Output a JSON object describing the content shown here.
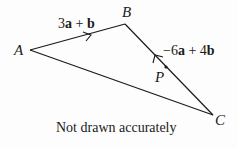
{
  "diagram": {
    "points": {
      "A": {
        "label": "A",
        "x": 30,
        "y": 50
      },
      "B": {
        "label": "B",
        "x": 125,
        "y": 24
      },
      "C": {
        "label": "C",
        "x": 213,
        "y": 115
      },
      "P": {
        "label": "P",
        "x": 166,
        "y": 67
      }
    },
    "vectors": {
      "AB": {
        "label": "3a + b",
        "parts": [
          "3",
          "a",
          " + ",
          "b"
        ]
      },
      "CB": {
        "label": "−6a + 4b",
        "parts": [
          "−6",
          "a",
          " + 4",
          "b"
        ]
      }
    },
    "note": "Not drawn accurately",
    "line_color": "#1a1a1a"
  }
}
